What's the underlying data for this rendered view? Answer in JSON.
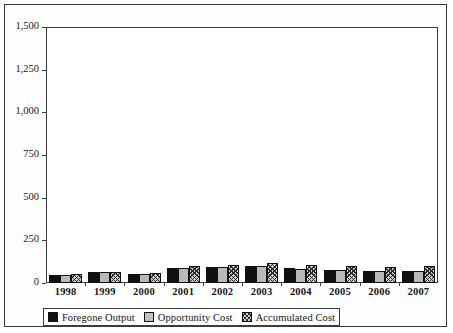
{
  "chart_data": {
    "type": "bar",
    "title": "",
    "xlabel": "",
    "ylabel": "",
    "categories": [
      "1998",
      "1999",
      "2000",
      "2001",
      "2002",
      "2003",
      "2004",
      "2005",
      "2006",
      "2007"
    ],
    "series": [
      {
        "name": "Foregone Output",
        "values": [
          48,
          62,
          52,
          90,
          95,
          100,
          88,
          78,
          72,
          72
        ]
      },
      {
        "name": "Opportunity Cost",
        "values": [
          48,
          62,
          52,
          90,
          92,
          100,
          85,
          78,
          72,
          70
        ]
      },
      {
        "name": "Accumulated Cost",
        "values": [
          50,
          65,
          58,
          98,
          105,
          118,
          103,
          98,
          95,
          98
        ]
      }
    ],
    "ylim": [
      0,
      1500
    ],
    "ytick_labels": [
      "0",
      "250",
      "500",
      "750",
      "1,000",
      "1,250",
      "1,500"
    ],
    "ytick_values": [
      0,
      250,
      500,
      750,
      1000,
      1250,
      1500
    ],
    "grid": false,
    "legend_position": "bottom"
  },
  "legend": {
    "items": [
      {
        "label": "Foregone Output",
        "swatch": "solid-black-swatch"
      },
      {
        "label": "Opportunity Cost",
        "swatch": "light-gray-swatch"
      },
      {
        "label": "Accumulated Cost",
        "swatch": "hatched-swatch"
      }
    ]
  },
  "colors": {
    "series_1": "#111111",
    "series_2": "#b9b9b9",
    "series_3": "#cfcfcf",
    "axis": "#3d3d3d",
    "frame": "#3a3a3a",
    "background": "#ffffff"
  }
}
